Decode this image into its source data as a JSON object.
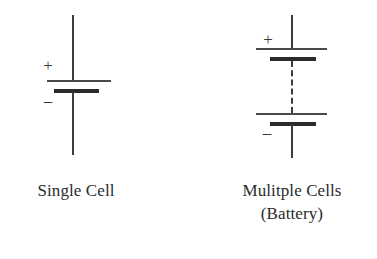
{
  "figure": {
    "background_color": "#ffffff",
    "ink_color": "#3a3a3a",
    "symbols": [
      {
        "id": "single-cell",
        "kind": "battery-cell-symbol",
        "polarity_plus": "+",
        "polarity_minus": "–",
        "caption": "Single Cell",
        "cell_count": 1,
        "has_dashed_continuation": false
      },
      {
        "id": "multiple-cells",
        "kind": "battery-multicell-symbol",
        "polarity_plus": "+",
        "polarity_minus": "–",
        "caption_line1": "Mulitple Cells",
        "caption_line2": "(Battery)",
        "cell_count": 2,
        "has_dashed_continuation": true
      }
    ]
  }
}
